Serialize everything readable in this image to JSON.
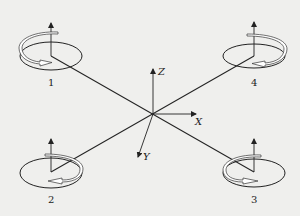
{
  "figure": {
    "background": "#efefed",
    "line_color": "#222222",
    "center": {
      "x": 153,
      "y": 114
    },
    "axes": [
      {
        "id": "z",
        "label": "Z",
        "tip": {
          "x": 153,
          "y": 68
        },
        "label_pos": {
          "x": 158,
          "y": 75
        }
      },
      {
        "id": "x",
        "label": "X",
        "tip": {
          "x": 197,
          "y": 114
        },
        "label_pos": {
          "x": 196,
          "y": 125
        }
      },
      {
        "id": "y",
        "label": "Y",
        "tip": {
          "x": 137,
          "y": 158
        },
        "label_pos": {
          "x": 143,
          "y": 158
        }
      }
    ],
    "rotors": [
      {
        "id": "1",
        "label": "1",
        "center": {
          "x": 51,
          "y": 56
        },
        "rotation": "counterclockwise-front",
        "label_pos": {
          "x": 51,
          "y": 86
        }
      },
      {
        "id": "2",
        "label": "2",
        "center": {
          "x": 51,
          "y": 172
        },
        "rotation": "counterclockwise-front",
        "label_pos": {
          "x": 51,
          "y": 203
        }
      },
      {
        "id": "3",
        "label": "3",
        "center": {
          "x": 254,
          "y": 172
        },
        "rotation": "clockwise-front",
        "label_pos": {
          "x": 254,
          "y": 203
        }
      },
      {
        "id": "4",
        "label": "4",
        "center": {
          "x": 254,
          "y": 56
        },
        "rotation": "clockwise-front",
        "label_pos": {
          "x": 254,
          "y": 86
        }
      }
    ]
  }
}
